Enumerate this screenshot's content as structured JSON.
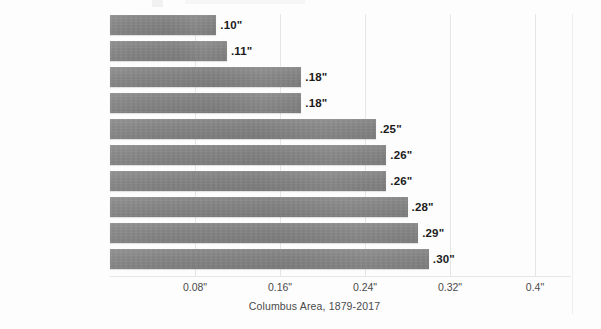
{
  "chart_data": {
    "type": "bar",
    "orientation": "horizontal",
    "title": "",
    "subtitle": "",
    "xlabel": "Columbus Area, 1879-2017",
    "ylabel": "",
    "xlim": [
      0,
      0.44
    ],
    "xticks": [
      "0.08\"",
      "0.16\"",
      "0.24\"",
      "0.32\"",
      "0.4\""
    ],
    "xtick_values": [
      0.08,
      0.16,
      0.24,
      0.32,
      0.4
    ],
    "grid": "vertical",
    "legend": "none",
    "categories": [
      "October 1924",
      "October 1963",
      "November 1917",
      "November 1904",
      "October 1944",
      "October 1934",
      "October 1879",
      "March 1910",
      "February 1978",
      "October 1887"
    ],
    "values": [
      0.1,
      0.11,
      0.18,
      0.18,
      0.25,
      0.26,
      0.26,
      0.28,
      0.29,
      0.3
    ],
    "data_labels": [
      ".10\"",
      ".11\"",
      ".18\"",
      ".18\"",
      ".25\"",
      ".26\"",
      ".26\"",
      ".28\"",
      ".29\"",
      ".30\""
    ],
    "bar_color": "#858585",
    "grid_color": "#e6e6e6",
    "text_color": "#3d3d3d",
    "background": "#fdfdfd"
  }
}
